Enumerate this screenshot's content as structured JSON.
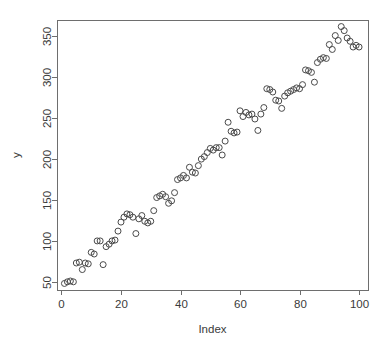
{
  "chart_data": {
    "type": "scatter",
    "title": "",
    "subtitle": "",
    "xlabel": "Index",
    "ylabel": "y",
    "xlim": [
      -1.5,
      103
    ],
    "ylim": [
      40,
      370
    ],
    "xticks": [
      0,
      20,
      40,
      60,
      80,
      100
    ],
    "yticks": [
      50,
      100,
      150,
      200,
      250,
      300,
      350
    ],
    "xtick_labels": [
      "0",
      "20",
      "40",
      "60",
      "80",
      "100"
    ],
    "ytick_labels": [
      "50",
      "100",
      "150",
      "200",
      "250",
      "300",
      "350"
    ],
    "grid": false,
    "legend": null,
    "marker": {
      "shape": "open-circle",
      "radius": 3.0,
      "stroke": "#4a4a4a",
      "fill": "none"
    },
    "box": true,
    "series": [
      {
        "name": "y",
        "x": [
          1,
          2,
          3,
          4,
          5,
          6,
          7,
          8,
          9,
          10,
          11,
          12,
          13,
          14,
          15,
          16,
          17,
          18,
          19,
          20,
          21,
          22,
          23,
          24,
          25,
          26,
          27,
          28,
          29,
          30,
          31,
          32,
          33,
          34,
          35,
          36,
          37,
          38,
          39,
          40,
          41,
          42,
          43,
          44,
          45,
          46,
          47,
          48,
          49,
          50,
          51,
          52,
          53,
          54,
          55,
          56,
          57,
          58,
          59,
          60,
          61,
          62,
          63,
          64,
          65,
          66,
          67,
          68,
          69,
          70,
          71,
          72,
          73,
          74,
          75,
          76,
          77,
          78,
          79,
          80,
          81,
          82,
          83,
          84,
          85,
          86,
          87,
          88,
          89,
          90,
          91,
          92,
          93,
          94,
          95,
          96,
          97,
          98,
          99,
          100
        ],
        "y": [
          48,
          50,
          51,
          50,
          73,
          74,
          65,
          73,
          72,
          86,
          84,
          100,
          100,
          71,
          93,
          96,
          100,
          101,
          112,
          123,
          129,
          133,
          132,
          129,
          109,
          127,
          131,
          124,
          122,
          124,
          137,
          153,
          155,
          157,
          154,
          146,
          149,
          159,
          175,
          177,
          180,
          177,
          190,
          184,
          183,
          192,
          200,
          203,
          208,
          213,
          211,
          214,
          214,
          205,
          222,
          245,
          234,
          232,
          233,
          259,
          252,
          257,
          254,
          255,
          249,
          235,
          255,
          263,
          286,
          285,
          282,
          272,
          271,
          262,
          277,
          281,
          283,
          285,
          287,
          286,
          291,
          309,
          308,
          306,
          294,
          318,
          322,
          324,
          323,
          340,
          334,
          351,
          345,
          362,
          357,
          348,
          344,
          337,
          339,
          337
        ]
      }
    ]
  },
  "plot": {
    "geometry": {
      "left": 57,
      "right": 368,
      "top": 20,
      "bottom": 290
    }
  }
}
